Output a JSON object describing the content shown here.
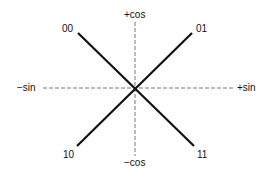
{
  "diagram": {
    "axes": {
      "positive_vertical": "+cos",
      "negative_vertical": "−cos",
      "negative_horizontal": "−sin",
      "positive_horizontal": "+sin"
    },
    "points": [
      {
        "label": "00",
        "quadrant": "top-left"
      },
      {
        "label": "01",
        "quadrant": "top-right"
      },
      {
        "label": "10",
        "quadrant": "bottom-left"
      },
      {
        "label": "11",
        "quadrant": "bottom-right"
      }
    ],
    "colors": {
      "line": "#111111",
      "axis": "#777777",
      "text": "#111111",
      "background": "#ffffff"
    }
  }
}
